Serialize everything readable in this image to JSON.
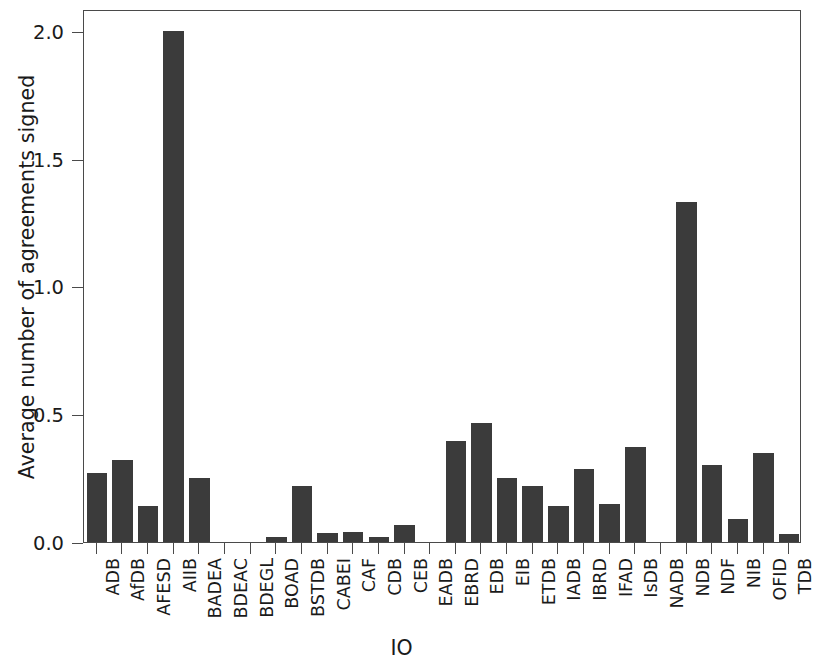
{
  "chart_data": {
    "type": "bar",
    "title": "",
    "xlabel": "IO",
    "ylabel": "Average number of agreements signed",
    "categories": [
      "ADB",
      "AfDB",
      "AFESD",
      "AIIB",
      "BADEA",
      "BDEAC",
      "BDEGL",
      "BOAD",
      "BSTDB",
      "CABEI",
      "CAF",
      "CDB",
      "CEB",
      "EADB",
      "EBRD",
      "EDB",
      "EIB",
      "ETDB",
      "IADB",
      "IBRD",
      "IFAD",
      "IsDB",
      "NADB",
      "NDB",
      "NDF",
      "NIB",
      "OFID",
      "TDB"
    ],
    "values": [
      0.27,
      0.32,
      0.14,
      2.0,
      0.25,
      0.0,
      0.0,
      0.02,
      0.22,
      0.035,
      0.04,
      0.02,
      0.065,
      0.0,
      0.395,
      0.465,
      0.25,
      0.22,
      0.14,
      0.285,
      0.15,
      0.37,
      0.0,
      1.33,
      0.3,
      0.09,
      0.35,
      0.03
    ],
    "ylim": [
      0.0,
      2.085
    ],
    "yticks": [
      0.0,
      0.5,
      1.0,
      1.5,
      2.0
    ],
    "ytick_labels": [
      "0.0",
      "0.5",
      "1.0",
      "1.5",
      "2.0"
    ],
    "grid": false,
    "legend": null,
    "bar_color": "#3b3b3b",
    "axis_color": "#4a4a4a",
    "background_color": "#ffffff"
  }
}
